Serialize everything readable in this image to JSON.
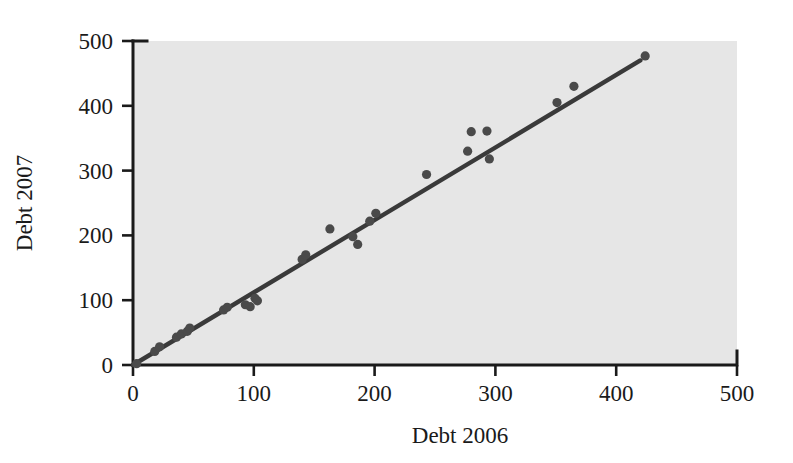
{
  "figure": {
    "background_color": "#ffffff",
    "plot_background_color": "#e6e6e6",
    "ink_color": "#1a1a1a",
    "point_color": "#4a4a4a",
    "line_color": "#3a3a3a"
  },
  "ghost_text": {
    "line_a": "",
    "line_b": "",
    "line_c": "",
    "line_d": "",
    "line_e": ""
  },
  "chart_data": {
    "type": "scatter",
    "title": "",
    "xlabel": "Debt 2006",
    "ylabel": "Debt 2007",
    "xlim": [
      0,
      500
    ],
    "ylim": [
      0,
      500
    ],
    "xticks": [
      0,
      100,
      200,
      300,
      400,
      500
    ],
    "yticks": [
      0,
      100,
      200,
      300,
      400,
      500
    ],
    "xtick_labels": [
      "0",
      "100",
      "200",
      "300",
      "400",
      "500"
    ],
    "ytick_labels": [
      "0",
      "100",
      "200",
      "300",
      "400",
      "500"
    ],
    "grid": false,
    "legend": null,
    "series": [
      {
        "name": "Debt",
        "marker": "circle",
        "points": [
          {
            "x": 3,
            "y": 2
          },
          {
            "x": 18,
            "y": 21
          },
          {
            "x": 22,
            "y": 28
          },
          {
            "x": 36,
            "y": 43
          },
          {
            "x": 40,
            "y": 48
          },
          {
            "x": 45,
            "y": 52
          },
          {
            "x": 47,
            "y": 57
          },
          {
            "x": 75,
            "y": 85
          },
          {
            "x": 78,
            "y": 89
          },
          {
            "x": 93,
            "y": 93
          },
          {
            "x": 97,
            "y": 90
          },
          {
            "x": 101,
            "y": 103
          },
          {
            "x": 103,
            "y": 99
          },
          {
            "x": 140,
            "y": 163
          },
          {
            "x": 143,
            "y": 170
          },
          {
            "x": 163,
            "y": 210
          },
          {
            "x": 182,
            "y": 198
          },
          {
            "x": 186,
            "y": 186
          },
          {
            "x": 196,
            "y": 222
          },
          {
            "x": 201,
            "y": 234
          },
          {
            "x": 243,
            "y": 294
          },
          {
            "x": 277,
            "y": 330
          },
          {
            "x": 280,
            "y": 360
          },
          {
            "x": 293,
            "y": 361
          },
          {
            "x": 295,
            "y": 318
          },
          {
            "x": 351,
            "y": 405
          },
          {
            "x": 365,
            "y": 430
          },
          {
            "x": 424,
            "y": 477
          }
        ]
      }
    ],
    "fit_line": {
      "name": "least-squares regression line",
      "x_start": 0,
      "y_start": 0,
      "x_end": 420,
      "y_end": 470
    }
  }
}
